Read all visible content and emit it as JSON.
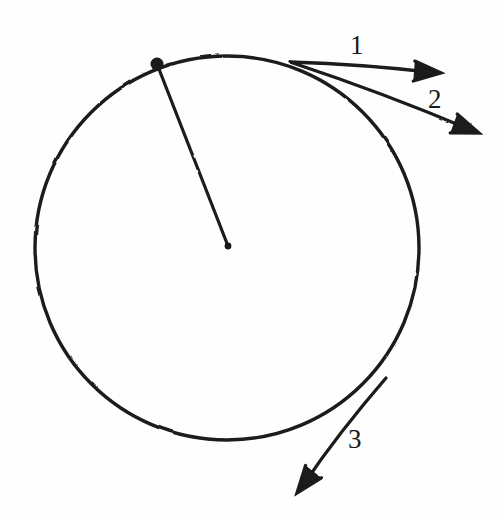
{
  "figure": {
    "background_color": "#fefefe",
    "ink_color": "#1a1a1a",
    "width": 504,
    "height": 523,
    "style": "hand-drawn pen sketch"
  },
  "circle": {
    "name": "circle",
    "center": {
      "x": 227,
      "y": 248
    },
    "radius": 192,
    "stroke_width": 3.4
  },
  "center_point": {
    "name": "center-dot",
    "x": 228,
    "y": 246,
    "radius": 3.4,
    "filled": true
  },
  "marked_point": {
    "name": "point-on-circle",
    "x": 157,
    "y": 64,
    "radius": 6.5,
    "filled": true
  },
  "radius_segment": {
    "name": "radius-line",
    "from": {
      "x": 157,
      "y": 64
    },
    "to": {
      "x": 228,
      "y": 246
    },
    "stroke_width": 3.2
  },
  "vectors": [
    {
      "label": "1",
      "name": "vector-1",
      "origin": {
        "x": 290,
        "y": 62
      },
      "tip": {
        "x": 441,
        "y": 73
      },
      "label_pos": {
        "x": 350,
        "y": 32
      },
      "description": "tangent-ish arrow pointing right"
    },
    {
      "label": "2",
      "name": "vector-2",
      "origin": {
        "x": 290,
        "y": 62
      },
      "tip": {
        "x": 479,
        "y": 133
      },
      "label_pos": {
        "x": 428,
        "y": 86
      },
      "description": "secant arrow pointing right-down"
    },
    {
      "label": "3",
      "name": "vector-3",
      "origin": {
        "x": 386,
        "y": 378
      },
      "tip": {
        "x": 297,
        "y": 493
      },
      "label_pos": {
        "x": 348,
        "y": 426
      },
      "description": "tangent arrow pointing down-left"
    }
  ],
  "labels": {
    "one": "1",
    "two": "2",
    "three": "3"
  }
}
